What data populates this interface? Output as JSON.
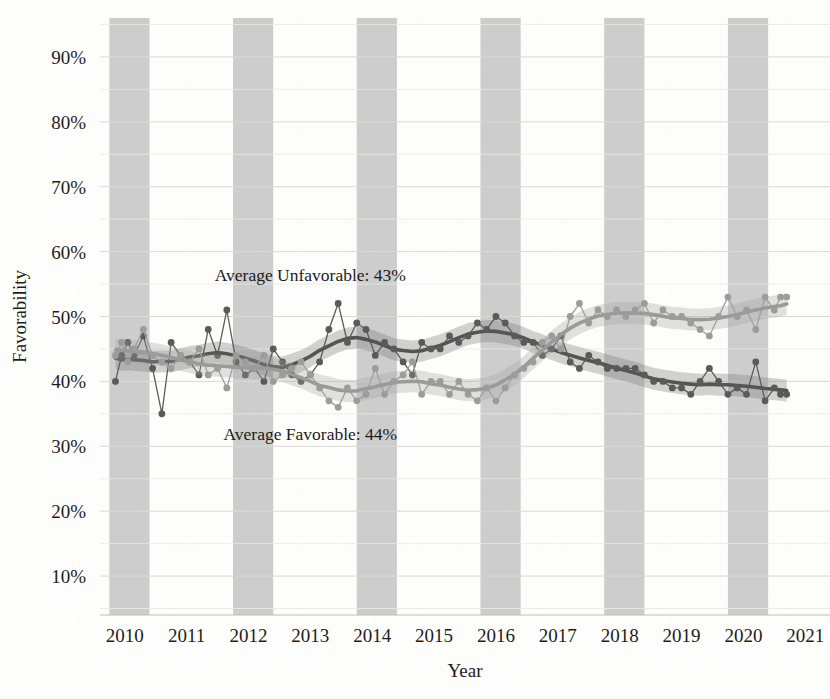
{
  "chart_data": {
    "type": "line",
    "title": "",
    "subtitle": "",
    "xlabel": "Year",
    "ylabel": "Favorability",
    "xlim": [
      2009.6,
      2021.4
    ],
    "ylim": [
      0.04,
      0.96
    ],
    "grid": true,
    "grid_major_step": "10%",
    "grid_minor_step": "5%",
    "legend_position": "none",
    "ytick_labels": [
      "10%",
      "20%",
      "30%",
      "40%",
      "50%",
      "60%",
      "70%",
      "80%",
      "90%"
    ],
    "ytick_values": [
      10,
      20,
      30,
      40,
      50,
      60,
      70,
      80,
      90
    ],
    "xtick_labels": [
      "2010",
      "2011",
      "2012",
      "2013",
      "2014",
      "2015",
      "2016",
      "2017",
      "2018",
      "2019",
      "2020",
      "2021"
    ],
    "xtick_values": [
      2010,
      2011,
      2012,
      2013,
      2014,
      2015,
      2016,
      2017,
      2018,
      2019,
      2020,
      2021
    ],
    "shaded_bands": [
      {
        "start": 2009.75,
        "end": 2010.4
      },
      {
        "start": 2011.75,
        "end": 2012.4
      },
      {
        "start": 2013.75,
        "end": 2014.4
      },
      {
        "start": 2015.75,
        "end": 2016.4
      },
      {
        "start": 2017.75,
        "end": 2018.4
      },
      {
        "start": 2019.75,
        "end": 2020.4
      }
    ],
    "annotations": [
      {
        "name": "average-unfavorable-annotation",
        "text": "Average Unfavorable: 43%",
        "x": 2013.0,
        "y": 55.5
      },
      {
        "name": "average-favorable-annotation",
        "text": "Average Favorable: 44%",
        "x": 2013.0,
        "y": 31.0
      }
    ],
    "series": [
      {
        "name": "Favorable",
        "color": "#5a5a5a",
        "smooth_color": "#545454",
        "band_color": "#6e6e6e",
        "average": 44,
        "x": [
          2009.85,
          2009.95,
          2010.05,
          2010.15,
          2010.3,
          2010.45,
          2010.6,
          2010.75,
          2010.9,
          2011.05,
          2011.2,
          2011.35,
          2011.5,
          2011.65,
          2011.8,
          2011.95,
          2012.1,
          2012.25,
          2012.4,
          2012.55,
          2012.7,
          2012.85,
          2013.0,
          2013.15,
          2013.3,
          2013.45,
          2013.6,
          2013.75,
          2013.9,
          2014.05,
          2014.2,
          2014.35,
          2014.5,
          2014.65,
          2014.8,
          2014.95,
          2015.1,
          2015.25,
          2015.4,
          2015.55,
          2015.7,
          2015.85,
          2016.0,
          2016.15,
          2016.3,
          2016.45,
          2016.6,
          2016.75,
          2016.9,
          2017.05,
          2017.2,
          2017.35,
          2017.5,
          2017.65,
          2017.8,
          2017.95,
          2018.1,
          2018.25,
          2018.4,
          2018.55,
          2018.7,
          2018.85,
          2019.0,
          2019.15,
          2019.3,
          2019.45,
          2019.6,
          2019.75,
          2019.9,
          2020.05,
          2020.2,
          2020.35,
          2020.5,
          2020.6,
          2020.7
        ],
        "y": [
          40,
          44,
          46,
          44,
          47,
          42,
          35,
          46,
          44,
          43,
          41,
          48,
          44,
          51,
          43,
          41,
          42,
          40,
          45,
          43,
          41,
          40,
          41,
          43,
          48,
          52,
          46,
          49,
          48,
          44,
          46,
          45,
          43,
          41,
          46,
          45,
          45,
          47,
          46,
          47,
          49,
          48,
          50,
          49,
          47,
          46,
          46,
          44,
          45,
          47,
          43,
          42,
          44,
          43,
          42,
          42,
          42,
          42,
          41,
          40,
          40,
          39,
          39,
          38,
          40,
          42,
          40,
          38,
          39,
          38,
          43,
          37,
          39,
          38,
          38
        ]
      },
      {
        "name": "Unfavorable",
        "color": "#9c9c9c",
        "smooth_color": "#9a9a9a",
        "band_color": "#9e9e9e",
        "average": 43,
        "x": [
          2009.85,
          2009.95,
          2010.05,
          2010.15,
          2010.3,
          2010.45,
          2010.6,
          2010.75,
          2010.9,
          2011.05,
          2011.2,
          2011.35,
          2011.5,
          2011.65,
          2011.8,
          2011.95,
          2012.1,
          2012.25,
          2012.4,
          2012.55,
          2012.7,
          2012.85,
          2013.0,
          2013.15,
          2013.3,
          2013.45,
          2013.6,
          2013.75,
          2013.9,
          2014.05,
          2014.2,
          2014.35,
          2014.5,
          2014.65,
          2014.8,
          2014.95,
          2015.1,
          2015.25,
          2015.4,
          2015.55,
          2015.7,
          2015.85,
          2016.0,
          2016.15,
          2016.3,
          2016.45,
          2016.6,
          2016.75,
          2016.9,
          2017.05,
          2017.2,
          2017.35,
          2017.5,
          2017.65,
          2017.8,
          2017.95,
          2018.1,
          2018.25,
          2018.4,
          2018.55,
          2018.7,
          2018.85,
          2019.0,
          2019.15,
          2019.3,
          2019.45,
          2019.6,
          2019.75,
          2019.9,
          2020.05,
          2020.2,
          2020.35,
          2020.5,
          2020.6,
          2020.7
        ],
        "y": [
          44,
          46,
          43,
          45,
          48,
          44,
          43,
          42,
          44,
          43,
          45,
          41,
          42,
          39,
          44,
          43,
          42,
          44,
          40,
          41,
          42,
          43,
          41,
          39,
          37,
          36,
          39,
          37,
          38,
          42,
          38,
          40,
          41,
          43,
          38,
          40,
          40,
          38,
          40,
          38,
          37,
          39,
          37,
          39,
          41,
          42,
          43,
          46,
          47,
          45,
          50,
          52,
          49,
          51,
          50,
          51,
          50,
          51,
          52,
          49,
          51,
          50,
          50,
          49,
          48,
          47,
          50,
          53,
          50,
          51,
          48,
          53,
          51,
          53,
          53
        ]
      }
    ]
  },
  "axes": {
    "ylabel": "Favorability",
    "xlabel": "Year"
  }
}
